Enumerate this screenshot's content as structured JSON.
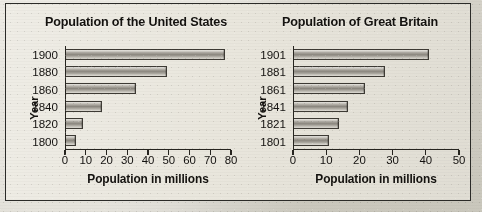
{
  "figure": {
    "background_color": "#e8e5db",
    "border_color": "#2b2b28",
    "bar_color": "#8e8a82"
  },
  "chart_data": [
    {
      "type": "bar",
      "orientation": "horizontal",
      "title": "Population of the United States",
      "xlabel": "Population in millions",
      "ylabel": "Year",
      "categories": [
        "1900",
        "1880",
        "1860",
        "1840",
        "1820",
        "1800"
      ],
      "values": [
        77,
        49,
        34,
        17.5,
        8,
        5
      ],
      "xlim": [
        0,
        80
      ],
      "xticks": [
        0,
        10,
        20,
        30,
        40,
        50,
        60,
        70,
        80
      ],
      "xtick_labels": [
        "0",
        "10",
        "20",
        "30",
        "40",
        "50",
        "60",
        "70",
        "80"
      ],
      "grid": false,
      "legend": false
    },
    {
      "type": "bar",
      "orientation": "horizontal",
      "title": "Population of Great Britain",
      "xlabel": "Population in millions",
      "ylabel": "Year",
      "categories": [
        "1901",
        "1881",
        "1861",
        "1841",
        "1821",
        "1801"
      ],
      "values": [
        41,
        27.5,
        21.5,
        16.5,
        13.5,
        10.5
      ],
      "xlim": [
        0,
        50
      ],
      "xticks": [
        0,
        10,
        20,
        30,
        40,
        50
      ],
      "xtick_labels": [
        "0",
        "10",
        "20",
        "30",
        "40",
        "50"
      ],
      "grid": false,
      "legend": false
    }
  ]
}
